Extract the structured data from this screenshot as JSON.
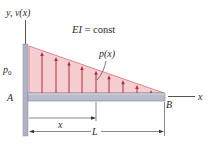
{
  "diagram": {
    "axis_label_y": "y, v(x)",
    "axis_label_x": "x",
    "stiffness_label": "EI = const",
    "load_label": "p(x)",
    "load_magnitude_label": "p0",
    "load_magnitude_sub": "0",
    "load_magnitude_base": "p",
    "point_a": "A",
    "point_b": "B",
    "dim_x": "x",
    "dim_L": "L"
  },
  "colors": {
    "load_fill": "#f6cdd0",
    "load_edge": "#d4707a",
    "arrow": "#a8323e",
    "beam_fill": "#b9bccb",
    "beam_edge": "#7c8094",
    "wall": "#aeb2c2",
    "line": "#3a3a3a"
  },
  "arrows_x": [
    42,
    56,
    69,
    82,
    96,
    109,
    123,
    137,
    151
  ]
}
